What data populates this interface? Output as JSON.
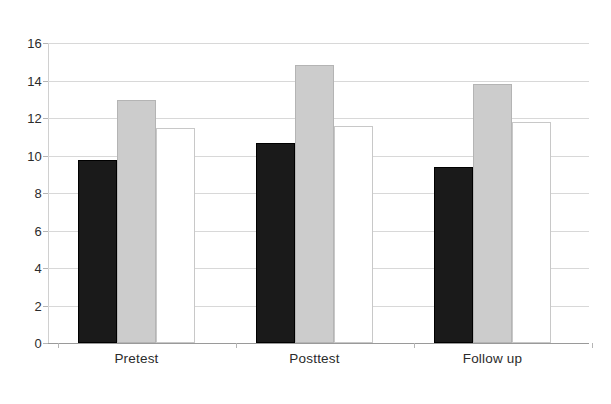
{
  "chart_data": {
    "type": "bar",
    "title": "",
    "subtitle": "",
    "xlabel": "",
    "ylabel": "",
    "categories": [
      "Pretest",
      "Posttest",
      "Follow up"
    ],
    "series": [
      {
        "name": "Series 1",
        "color": "#1a1a1a",
        "fill": "black",
        "values": [
          9.75,
          10.65,
          9.4
        ]
      },
      {
        "name": "Series 2",
        "color": "#cccccc",
        "fill": "light gray",
        "values": [
          12.95,
          14.85,
          13.8
        ]
      },
      {
        "name": "Series 3",
        "color": "#ffffff",
        "fill": "white",
        "values": [
          11.45,
          11.55,
          11.8
        ]
      }
    ],
    "ylim": [
      0,
      16
    ],
    "ytick_step": 2,
    "yticks": [
      0,
      2,
      4,
      6,
      8,
      10,
      12,
      14,
      16
    ],
    "ytick_labels": [
      "0",
      "2",
      "4",
      "6",
      "8",
      "10",
      "12",
      "14",
      "16"
    ],
    "grid": true,
    "grid_axis": "y",
    "legend": false,
    "legend_position": "none",
    "annotations": []
  }
}
